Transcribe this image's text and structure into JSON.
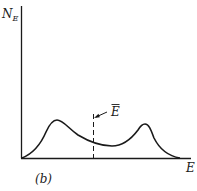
{
  "figure": {
    "panel_label": "(b)",
    "y_axis_label": "N",
    "y_axis_subscript": "E",
    "x_axis_label": "E",
    "mean_marker_label": "E",
    "mean_marker_has_overbar": true,
    "colors": {
      "ink": "#1a1a1a",
      "background": "#ffffff"
    }
  }
}
